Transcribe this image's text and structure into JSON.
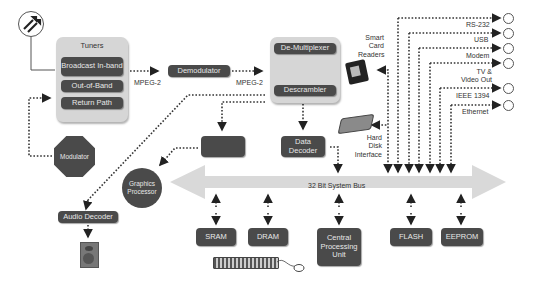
{
  "diagram": {
    "bus": {
      "label": "32 Bit System Bus",
      "color": "#d9d9d9"
    },
    "tuners": {
      "title": "Tuners",
      "items": [
        "Broadcast In-band",
        "Out-of-Band",
        "Return Path"
      ]
    },
    "demodulator": "Demodulator",
    "mpeg_labels": [
      "MPEG-2",
      "MPEG-2"
    ],
    "demux_group": {
      "items": [
        "De-Multiplexer",
        "Descrambler"
      ]
    },
    "modulator": "Modulator",
    "unlabeled_block": "",
    "data_decoder": "Data Decoder",
    "graphics_processor": "Graphics Processor",
    "audio_decoder": "Audio Decoder",
    "smart_card": "Smart Card Readers",
    "hard_disk": "Hard Disk Interface",
    "ports": [
      "RS-232",
      "USB",
      "Modem",
      "TV & Video Out",
      "IEEE 1394",
      "Ethernet"
    ],
    "memory": [
      "SRAM",
      "DRAM",
      "Central Processing Unit",
      "FLASH",
      "EEPROM"
    ],
    "colors": {
      "block": "#4a4a4a",
      "group": "#d6d6d6",
      "line": "#333333"
    }
  }
}
